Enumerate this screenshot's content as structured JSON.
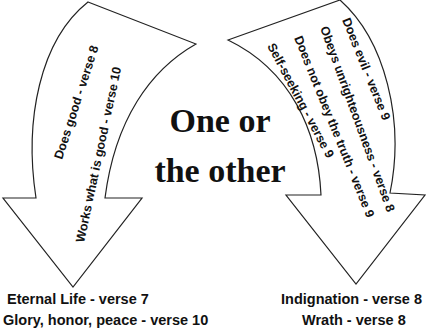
{
  "diagram": {
    "center_title": {
      "line1": "One or",
      "line2": "the other"
    },
    "left_arrow": {
      "direction": "down",
      "items": [
        "Does good - verse 8",
        "Works what is good - verse 10"
      ],
      "outcomes": [
        "Eternal Life - verse 7",
        "Glory, honor, peace - verse 10"
      ]
    },
    "right_arrow": {
      "direction": "down",
      "items": [
        "Does evil - verse 9",
        "Obeys unrighteousness - verse 8",
        "Does not obey the truth - verse 9",
        "Self-seeking - verse 9"
      ],
      "outcomes": [
        "Indignation - verse 8",
        "Wrath - verse 8"
      ]
    },
    "colors": {
      "background": "#ffffff",
      "stroke": "#222222",
      "text": "#111111"
    }
  }
}
